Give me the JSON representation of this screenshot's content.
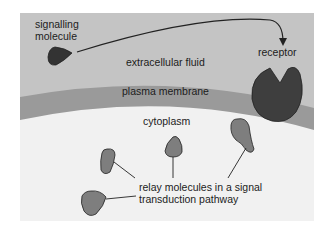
{
  "diagram": {
    "regions": {
      "extracellular": "extracellular fluid",
      "membrane": "plasma membrane",
      "cytoplasm": "cytoplasm"
    },
    "labels": {
      "signalling_molecule_line1": "signalling",
      "signalling_molecule_line2": "molecule",
      "receptor": "receptor",
      "relay_line1": "relay molecules in a signal",
      "relay_line2": "transduction pathway"
    },
    "colors": {
      "background": "#ffffff",
      "extracellular": "#c4c4c4",
      "membrane": "#9a9a9a",
      "cytoplasm": "#f1f1f1",
      "signalling_molecule": "#333333",
      "receptor": "#3e3e3e",
      "relay_molecule": "#7e7e7e",
      "outline": "#222222"
    }
  }
}
